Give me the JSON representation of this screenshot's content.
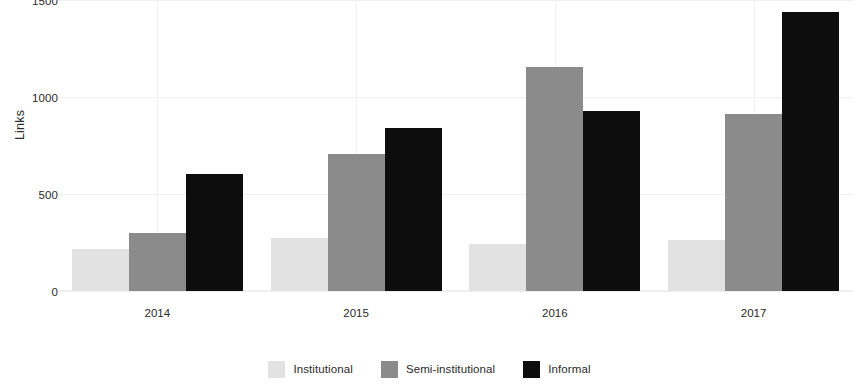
{
  "chart_data": {
    "type": "bar",
    "title": "",
    "subtitle": "",
    "xlabel": "",
    "ylabel": "Links",
    "categories": [
      "2014",
      "2015",
      "2016",
      "2017"
    ],
    "series": [
      {
        "name": "Institutional",
        "color": "#e2e2e2",
        "values": [
          215,
          275,
          240,
          265
        ]
      },
      {
        "name": "Semi-institutional",
        "color": "#8b8b8b",
        "values": [
          300,
          705,
          1155,
          910
        ]
      },
      {
        "name": "Informal",
        "color": "#0d0d0d",
        "values": [
          605,
          840,
          930,
          1440
        ]
      }
    ],
    "ylim": [
      0,
      1500
    ],
    "yticks": [
      0,
      500,
      1000,
      1500
    ],
    "ytick_labels": [
      "0",
      "500",
      "1000",
      "1500"
    ],
    "grid": true,
    "grid_color": "#efefef",
    "legend_position": "bottom",
    "background": "#ffffff",
    "grouping": "grouped"
  },
  "axes": {
    "y_title": "Links",
    "y_tick_0": "0",
    "y_tick_1": "500",
    "y_tick_2": "1000",
    "y_tick_3": "1500",
    "x_tick_0": "2014",
    "x_tick_1": "2015",
    "x_tick_2": "2016",
    "x_tick_3": "2017"
  },
  "legend": {
    "items": [
      {
        "label": "Institutional",
        "color": "#e2e2e2"
      },
      {
        "label": "Semi-institutional",
        "color": "#8b8b8b"
      },
      {
        "label": "Informal",
        "color": "#0d0d0d"
      }
    ]
  }
}
